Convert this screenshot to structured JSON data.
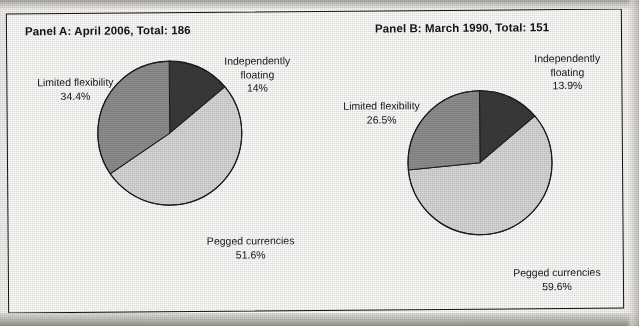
{
  "figure": {
    "background_color": "#fdfdfc",
    "border_color": "#121212"
  },
  "panels": [
    {
      "id": "panel-a",
      "title": "Panel A: April 2006, Total: 186",
      "period": "April 2006",
      "total": 186,
      "labels": {
        "limited_name": "Limited flexibility",
        "limited_pct": "34.4%",
        "floating_name_line1": "Independently",
        "floating_name_line2": "floating",
        "floating_pct": "14%",
        "pegged_name": "Pegged currencies",
        "pegged_pct": "51.6%"
      }
    },
    {
      "id": "panel-b",
      "title": "Panel B: March 1990, Total: 151",
      "period": "March 1990",
      "total": 151,
      "labels": {
        "limited_name": "Limited flexibility",
        "limited_pct": "26.5%",
        "floating_name_line1": "Independently",
        "floating_name_line2": "floating",
        "floating_pct": "13.9%",
        "pegged_name": "Pegged currencies",
        "pegged_pct": "59.6%"
      }
    }
  ],
  "colors": {
    "independently_floating": "#3a3a3a",
    "limited_flexibility": "#8e8e8e",
    "pegged_currencies": "#d8d8d8",
    "slice_outline": "#1c1c1c",
    "text": "#161616"
  },
  "chart_data": [
    {
      "type": "pie",
      "title": "Panel A: April 2006, Total: 186",
      "total": 186,
      "start_angle_deg": 0,
      "direction": "clockwise",
      "categories": [
        "Independently floating",
        "Pegged currencies",
        "Limited flexibility"
      ],
      "values": [
        14.0,
        51.6,
        34.4
      ],
      "value_labels": [
        "14%",
        "51.6%",
        "34.4%"
      ],
      "counts": [
        26,
        96,
        64
      ],
      "colors": [
        "#3a3a3a",
        "#d8d8d8",
        "#8e8e8e"
      ],
      "legend": "none (direct slice labels)",
      "grid": false
    },
    {
      "type": "pie",
      "title": "Panel B: March 1990, Total: 151",
      "total": 151,
      "start_angle_deg": 0,
      "direction": "clockwise",
      "categories": [
        "Independently floating",
        "Pegged currencies",
        "Limited flexibility"
      ],
      "values": [
        13.9,
        59.6,
        26.5
      ],
      "value_labels": [
        "13.9%",
        "59.6%",
        "26.5%"
      ],
      "counts": [
        21,
        90,
        40
      ],
      "colors": [
        "#3a3a3a",
        "#d8d8d8",
        "#8e8e8e"
      ],
      "legend": "none (direct slice labels)",
      "grid": false
    }
  ]
}
